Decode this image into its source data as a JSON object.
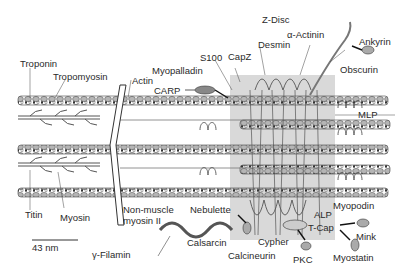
{
  "diagram": {
    "title": "Z-Disc",
    "labels": {
      "z_disc": "Z-Disc",
      "troponin": "Troponin",
      "tropomyosin": "Tropomyosin",
      "actin": "Actin",
      "myopalladin": "Myopalladin",
      "s100": "S100",
      "capz": "CapZ",
      "desmin": "Desmin",
      "alpha_actinin": "α-Actinin",
      "ankyrin": "Ankyrin",
      "obscurin": "Obscurin",
      "carp": "CARP",
      "mlp": "MLP",
      "titin": "Titin",
      "myosin": "Myosin",
      "non_muscle_myosin": "Non-muscle",
      "non_muscle_myosin_2": "myosin II",
      "nebulette": "Nebulette",
      "gamma_filamin": "γ-Filamin",
      "calsarcin": "Calsarcin",
      "calcineurin": "Calcineurin",
      "cypher": "Cypher",
      "pkc": "PKC",
      "t_cap": "T-Cap",
      "alp": "ALP",
      "myopodin": "Myopodin",
      "mink": "Mink",
      "myostatin": "Myostatin"
    },
    "scale_bar": {
      "label": "43 nm"
    },
    "colors": {
      "zdisc_shade": "#d9d9d9",
      "filament": "#8c8c8c",
      "bead": "#b5b5b5",
      "outline": "#3a3a3a",
      "gamma_filamin": "#555555"
    }
  }
}
